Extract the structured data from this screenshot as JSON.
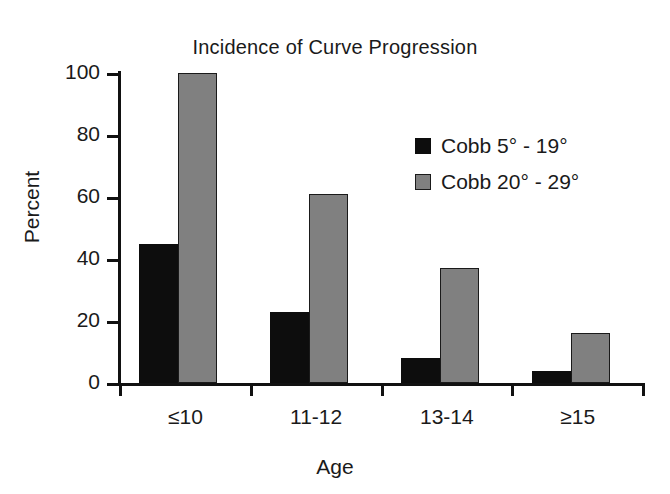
{
  "chart_data": {
    "type": "bar",
    "title": "Incidence of Curve Progression",
    "xlabel": "Age",
    "ylabel": "Percent",
    "categories": [
      "≤10",
      "11-12",
      "13-14",
      "≥15"
    ],
    "series": [
      {
        "name": "Cobb 5° - 19°",
        "color": "#0d0d0d",
        "values": [
          45,
          23,
          8,
          4
        ]
      },
      {
        "name": "Cobb 20° - 29°",
        "color": "#808080",
        "values": [
          100,
          61,
          37,
          16
        ]
      }
    ],
    "ylim": [
      0,
      100
    ],
    "yticks": [
      0,
      20,
      40,
      60,
      80,
      100
    ],
    "ytick_labels": [
      "0",
      "20",
      "40",
      "60",
      "80",
      "100"
    ],
    "grid": false,
    "legend_position": "upper right",
    "orientation": "vertical",
    "grouping": "grouped"
  },
  "legend": {
    "entries": [
      {
        "label": "Cobb 5° - 19°",
        "swatch": "black-square-swatch"
      },
      {
        "label": "Cobb 20° - 29°",
        "swatch": "gray-square-swatch"
      }
    ]
  },
  "colors": {
    "series_black": "#0d0d0d",
    "series_gray": "#808080",
    "axis": "#111111",
    "background": "#ffffff",
    "text": "#1a1a1a"
  }
}
